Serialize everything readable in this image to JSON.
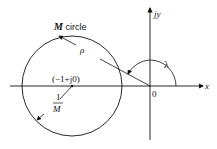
{
  "diagram": {
    "labels": {
      "circle_title_italic": "M",
      "circle_title_rest": " circle",
      "rho": "ρ",
      "lambda": "λ",
      "center": "(−1+j0)",
      "frac_num": "1",
      "frac_den": "M",
      "origin": "0",
      "x_axis": "x",
      "y_axis": "jy"
    },
    "geometry": {
      "circle_center": [
        72,
        86
      ],
      "circle_radius": 50,
      "origin": [
        150,
        86
      ]
    },
    "colors": {
      "ink": "#111111",
      "background": "#ffffff"
    }
  }
}
